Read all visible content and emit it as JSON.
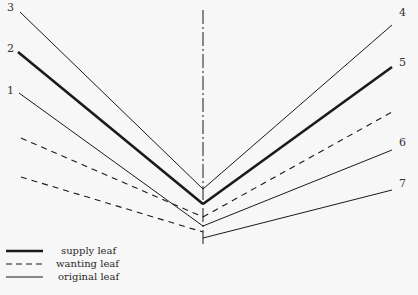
{
  "diagram": {
    "title": "",
    "axis": {
      "x": 203,
      "y1": 10,
      "y2": 244,
      "style": "dash-dot"
    },
    "line_labels": [
      {
        "text": "3",
        "x": 7,
        "y": 2
      },
      {
        "text": "2",
        "x": 7,
        "y": 43
      },
      {
        "text": "1",
        "x": 7,
        "y": 85
      },
      {
        "text": "4",
        "x": 399,
        "y": 7
      },
      {
        "text": "5",
        "x": 399,
        "y": 57
      },
      {
        "text": "6",
        "x": 399,
        "y": 137
      },
      {
        "text": "7",
        "x": 399,
        "y": 178
      }
    ],
    "lines": [
      {
        "id": "left-3",
        "type": "original",
        "x1": 20,
        "y1": 12,
        "x2": 203,
        "y2": 189
      },
      {
        "id": "left-2",
        "type": "supply",
        "x1": 18,
        "y1": 52,
        "x2": 203,
        "y2": 204
      },
      {
        "id": "left-1",
        "type": "original",
        "x1": 19,
        "y1": 93,
        "x2": 203,
        "y2": 226
      },
      {
        "id": "left-dash-upper",
        "type": "wanting",
        "x1": 21,
        "y1": 138,
        "x2": 203,
        "y2": 217
      },
      {
        "id": "left-dash-lower",
        "type": "wanting",
        "x1": 21,
        "y1": 177,
        "x2": 203,
        "y2": 232
      },
      {
        "id": "right-4",
        "type": "original",
        "x1": 203,
        "y1": 189,
        "x2": 392,
        "y2": 25
      },
      {
        "id": "right-5",
        "type": "supply",
        "x1": 203,
        "y1": 204,
        "x2": 392,
        "y2": 67
      },
      {
        "id": "right-dash",
        "type": "wanting",
        "x1": 203,
        "y1": 217,
        "x2": 392,
        "y2": 112
      },
      {
        "id": "right-6",
        "type": "original",
        "x1": 203,
        "y1": 226,
        "x2": 392,
        "y2": 150
      },
      {
        "id": "right-7",
        "type": "original",
        "x1": 203,
        "y1": 238,
        "x2": 392,
        "y2": 190
      }
    ],
    "legend": [
      {
        "label": "supply leaf",
        "type": "supply"
      },
      {
        "label": "wanting leaf",
        "type": "wanting"
      },
      {
        "label": "original leaf",
        "type": "original"
      }
    ],
    "colors": {
      "background": "#f7f7f7",
      "ink": "#1a1a1a"
    }
  }
}
